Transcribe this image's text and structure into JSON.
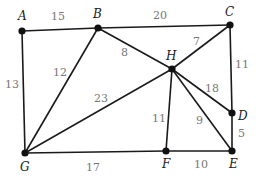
{
  "diagram": {
    "type": "weighted-graph",
    "nodes": [
      {
        "id": "A",
        "x": 22,
        "y": 31,
        "lx": 18,
        "ly": 20
      },
      {
        "id": "B",
        "x": 98,
        "y": 28,
        "lx": 93,
        "ly": 18
      },
      {
        "id": "C",
        "x": 230,
        "y": 25,
        "lx": 225,
        "ly": 16
      },
      {
        "id": "H",
        "x": 172,
        "y": 69,
        "lx": 166,
        "ly": 60
      },
      {
        "id": "D",
        "x": 232,
        "y": 113,
        "lx": 238,
        "ly": 120
      },
      {
        "id": "E",
        "x": 232,
        "y": 151,
        "lx": 229,
        "ly": 168
      },
      {
        "id": "F",
        "x": 166,
        "y": 151,
        "lx": 162,
        "ly": 168
      },
      {
        "id": "G",
        "x": 25,
        "y": 153,
        "lx": 20,
        "ly": 171
      }
    ],
    "edges": [
      {
        "from": "A",
        "to": "B",
        "weight": "15",
        "lx": 51,
        "ly": 20
      },
      {
        "from": "B",
        "to": "C",
        "weight": "20",
        "lx": 153,
        "ly": 19
      },
      {
        "from": "A",
        "to": "G",
        "weight": "13",
        "lx": 5,
        "ly": 88
      },
      {
        "from": "B",
        "to": "G",
        "weight": "12",
        "lx": 53,
        "ly": 76
      },
      {
        "from": "B",
        "to": "H",
        "weight": "8",
        "lx": 121,
        "ly": 56
      },
      {
        "from": "C",
        "to": "H",
        "weight": "7",
        "lx": 193,
        "ly": 45
      },
      {
        "from": "C",
        "to": "D",
        "weight": "11",
        "lx": 235,
        "ly": 68
      },
      {
        "from": "H",
        "to": "G",
        "weight": "23",
        "lx": 94,
        "ly": 102
      },
      {
        "from": "H",
        "to": "D",
        "weight": "18",
        "lx": 205,
        "ly": 92
      },
      {
        "from": "H",
        "to": "F",
        "weight": "11",
        "lx": 152,
        "ly": 122
      },
      {
        "from": "H",
        "to": "E",
        "weight": "9",
        "lx": 196,
        "ly": 124
      },
      {
        "from": "D",
        "to": "E",
        "weight": "5",
        "lx": 238,
        "ly": 137
      },
      {
        "from": "G",
        "to": "F",
        "weight": "17",
        "lx": 86,
        "ly": 171
      },
      {
        "from": "F",
        "to": "E",
        "weight": "10",
        "lx": 194,
        "ly": 168
      }
    ]
  }
}
